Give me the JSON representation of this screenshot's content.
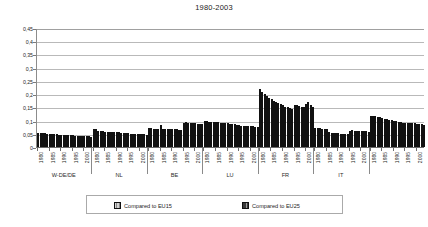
{
  "chart_data": {
    "type": "bar",
    "title": "1980-2003",
    "xlabel": "",
    "ylabel": "",
    "ylim": [
      0,
      0.45
    ],
    "ytick_labels": [
      "0,45",
      "0,4",
      "0,35",
      "0,3",
      "0,25",
      "0,2",
      "0,15",
      "0,1",
      "0,05",
      "0"
    ],
    "ytick_values": [
      0.45,
      0.4,
      0.35,
      0.3,
      0.25,
      0.2,
      0.15,
      0.1,
      0.05,
      0
    ],
    "grid": true,
    "legend_position": "bottom",
    "legend": [
      "Compared to EU15",
      "Compared to EU25"
    ],
    "series_names": [
      "Compared to EU15",
      "Compared to EU25"
    ],
    "year_tick_labels": [
      "1980",
      "1985",
      "1990",
      "1995",
      "2000"
    ],
    "groups": [
      {
        "label": "W-DE/DE",
        "years": [
          1980,
          1981,
          1982,
          1983,
          1984,
          1985,
          1986,
          1987,
          1988,
          1989,
          1990,
          1991,
          1992,
          1993,
          1994,
          1995,
          1996,
          1997,
          1998,
          1999,
          2000,
          2001,
          2002,
          2003
        ],
        "series": [
          {
            "name": "Compared to EU15",
            "values": [
              0.052,
              0.054,
              0.053,
              0.052,
              0.051,
              0.05,
              0.049,
              0.048,
              0.048,
              0.047,
              0.047,
              0.046,
              0.047,
              0.046,
              0.045,
              null,
              null,
              null,
              null,
              null,
              null,
              null,
              null,
              null
            ]
          },
          {
            "name": "Compared to EU25",
            "values": [
              null,
              null,
              null,
              null,
              null,
              null,
              null,
              null,
              null,
              null,
              null,
              null,
              null,
              null,
              null,
              0.044,
              0.043,
              0.043,
              0.042,
              0.041,
              0.041,
              0.04,
              0.04,
              0.039
            ]
          }
        ]
      },
      {
        "label": "NL",
        "years": [
          1980,
          1981,
          1982,
          1983,
          1984,
          1985,
          1986,
          1987,
          1988,
          1989,
          1990,
          1991,
          1992,
          1993,
          1994,
          1995,
          1996,
          1997,
          1998,
          1999,
          2000,
          2001,
          2002,
          2003
        ],
        "series": [
          {
            "name": "Compared to EU15",
            "values": [
              0.07,
              0.068,
              0.061,
              0.06,
              0.059,
              0.058,
              0.057,
              0.057,
              0.056,
              0.056,
              0.055,
              0.055,
              0.054,
              0.054,
              0.053,
              null,
              null,
              null,
              null,
              null,
              null,
              null,
              null,
              null
            ]
          },
          {
            "name": "Compared to EU25",
            "values": [
              null,
              null,
              null,
              null,
              null,
              null,
              null,
              null,
              null,
              null,
              null,
              null,
              null,
              null,
              null,
              0.052,
              0.051,
              0.051,
              0.05,
              0.05,
              0.049,
              0.049,
              0.048,
              0.047
            ]
          }
        ]
      },
      {
        "label": "BE",
        "years": [
          1980,
          1981,
          1982,
          1983,
          1984,
          1985,
          1986,
          1987,
          1988,
          1989,
          1990,
          1991,
          1992,
          1993,
          1994,
          1995,
          1996,
          1997,
          1998,
          1999,
          2000,
          2001,
          2002,
          2003
        ],
        "series": [
          {
            "name": "Compared to EU15",
            "values": [
              0.072,
              0.071,
              0.07,
              0.069,
              0.069,
              0.082,
              0.069,
              0.068,
              0.068,
              0.067,
              0.067,
              0.068,
              0.067,
              0.066,
              0.066,
              null,
              null,
              null,
              null,
              null,
              null,
              null,
              null,
              null
            ]
          },
          {
            "name": "Compared to EU25",
            "values": [
              null,
              null,
              null,
              null,
              null,
              null,
              null,
              null,
              null,
              null,
              null,
              null,
              null,
              null,
              null,
              0.09,
              0.093,
              0.092,
              0.091,
              0.09,
              0.089,
              0.088,
              0.087,
              0.086
            ]
          }
        ]
      },
      {
        "label": "LU",
        "years": [
          1980,
          1981,
          1982,
          1983,
          1984,
          1985,
          1986,
          1987,
          1988,
          1989,
          1990,
          1991,
          1992,
          1993,
          1994,
          1995,
          1996,
          1997,
          1998,
          1999,
          2000,
          2001,
          2002,
          2003
        ],
        "series": [
          {
            "name": "Compared to EU15",
            "values": [
              0.098,
              0.097,
              0.096,
              0.095,
              0.095,
              0.094,
              0.093,
              0.092,
              0.091,
              0.09,
              0.089,
              0.088,
              0.087,
              0.086,
              0.084,
              null,
              null,
              null,
              null,
              null,
              null,
              null,
              null,
              null
            ]
          },
          {
            "name": "Compared to EU25",
            "values": [
              null,
              null,
              null,
              null,
              null,
              null,
              null,
              null,
              null,
              null,
              null,
              null,
              null,
              null,
              null,
              0.082,
              0.081,
              0.081,
              0.08,
              0.079,
              0.079,
              0.078,
              0.077,
              0.076
            ]
          }
        ]
      },
      {
        "label": "FR",
        "years": [
          1980,
          1981,
          1982,
          1983,
          1984,
          1985,
          1986,
          1987,
          1988,
          1989,
          1990,
          1991,
          1992,
          1993,
          1994,
          1995,
          1996,
          1997,
          1998,
          1999,
          2000,
          2001,
          2002,
          2003
        ],
        "series": [
          {
            "name": "Compared to EU15",
            "values": [
              0.219,
              0.207,
              0.199,
              0.192,
              0.186,
              0.18,
              0.174,
              0.169,
              0.165,
              0.161,
              0.157,
              0.153,
              0.15,
              0.147,
              0.145,
              null,
              null,
              null,
              null,
              null,
              null,
              null,
              null,
              null
            ]
          },
          {
            "name": "Compared to EU25",
            "values": [
              null,
              null,
              null,
              null,
              null,
              null,
              null,
              null,
              null,
              null,
              null,
              null,
              null,
              null,
              null,
              0.16,
              0.158,
              0.156,
              0.153,
              0.152,
              0.164,
              0.172,
              0.16,
              0.15
            ]
          }
        ]
      },
      {
        "label": "IT",
        "years": [
          1980,
          1981,
          1982,
          1983,
          1984,
          1985,
          1986,
          1987,
          1988,
          1989,
          1990,
          1991,
          1992,
          1993,
          1994,
          1995,
          1996,
          1997,
          1998,
          1999,
          2000,
          2001,
          2002,
          2003
        ],
        "series": [
          {
            "name": "Compared to EU15",
            "values": [
              0.073,
              0.072,
              0.071,
              0.07,
              0.069,
              0.068,
              0.058,
              0.054,
              0.053,
              0.052,
              0.052,
              0.051,
              0.051,
              0.05,
              0.05,
              null,
              null,
              null,
              null,
              null,
              null,
              null,
              null,
              null
            ]
          },
          {
            "name": "Compared to EU25",
            "values": [
              null,
              null,
              null,
              null,
              null,
              null,
              null,
              null,
              null,
              null,
              null,
              null,
              null,
              null,
              null,
              0.06,
              0.063,
              0.062,
              0.062,
              0.061,
              0.06,
              0.06,
              0.059,
              0.058
            ]
          }
        ]
      },
      {
        "label": "",
        "years": [
          1980,
          1981,
          1982,
          1983,
          1984,
          1985,
          1986,
          1987,
          1988,
          1989,
          1990,
          1991,
          1992,
          1993,
          1994,
          1995,
          1996,
          1997,
          1998,
          1999,
          2000,
          2001,
          2002,
          2003
        ],
        "series": [
          {
            "name": "Compared to EU15",
            "values": [
              0.118,
              0.117,
              0.116,
              0.114,
              0.112,
              0.11,
              0.107,
              0.105,
              0.103,
              0.101,
              0.099,
              0.097,
              0.095,
              0.093,
              0.092,
              null,
              null,
              null,
              null,
              null,
              null,
              null,
              null,
              null
            ]
          },
          {
            "name": "Compared to EU25",
            "values": [
              null,
              null,
              null,
              null,
              null,
              null,
              null,
              null,
              null,
              null,
              null,
              null,
              null,
              null,
              null,
              0.09,
              0.091,
              0.09,
              0.089,
              0.089,
              0.088,
              0.087,
              0.086,
              0.085
            ]
          }
        ]
      }
    ]
  }
}
